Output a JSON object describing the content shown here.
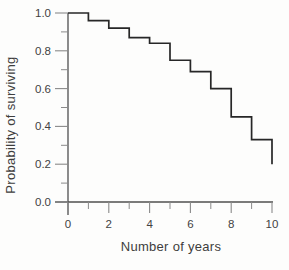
{
  "figure": {
    "title": ""
  },
  "chart_data": {
    "type": "line",
    "style": "step-after",
    "title": "",
    "xlabel": "Number of years",
    "ylabel": "Probability of surviving",
    "x": [
      0,
      1,
      2,
      3,
      4,
      5,
      6,
      7,
      8,
      9,
      10
    ],
    "values": [
      1.0,
      0.96,
      0.92,
      0.87,
      0.84,
      0.75,
      0.69,
      0.6,
      0.45,
      0.33,
      0.2
    ],
    "xlim": [
      0,
      10
    ],
    "ylim": [
      0.0,
      1.0
    ],
    "x_major_ticks": {
      "values": [
        0,
        2,
        4,
        6,
        8,
        10
      ],
      "labels": [
        "0",
        "2",
        "4",
        "6",
        "8",
        "10"
      ]
    },
    "x_minor_ticks": [
      1,
      3,
      5,
      7,
      9
    ],
    "y_major_ticks": {
      "values": [
        0.0,
        0.2,
        0.4,
        0.6,
        0.8,
        1.0
      ],
      "labels": [
        "0.0",
        "0.2",
        "0.4",
        "0.6",
        "0.8",
        "1.0"
      ]
    },
    "y_minor_ticks": [
      0.1,
      0.3,
      0.5,
      0.7,
      0.9
    ],
    "grid": false,
    "legend": null,
    "colors": {
      "line": "#272727",
      "axis": "#4f4f4f",
      "tick": "#8a8a8a",
      "text": "#424242",
      "background": "#fdfdfc"
    }
  }
}
